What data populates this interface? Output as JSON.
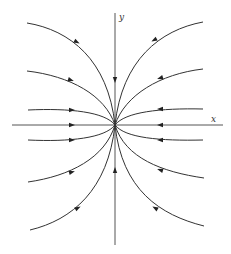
{
  "diagram": {
    "type": "phase-portrait",
    "axes": {
      "x_label": "x",
      "y_label": "y"
    },
    "origin": [
      115,
      125
    ],
    "colors": {
      "stroke": "#333333",
      "background": "#ffffff"
    },
    "trajectories": [
      {
        "name": "upper-left-outer",
        "d": "M27,23 C70,30 108,60 115,125",
        "arrow": [
          77,
          42
        ],
        "angle": 28
      },
      {
        "name": "upper-left-inner",
        "d": "M27,71 C70,76 105,95 115,125",
        "arrow": [
          71,
          80
        ],
        "angle": 18
      },
      {
        "name": "left-upper-flat",
        "d": "M28,110 C70,108 105,112 115,125",
        "arrow": [
          72,
          110
        ],
        "angle": 0
      },
      {
        "name": "left-lower-flat",
        "d": "M28,140 C70,142 105,138 115,125",
        "arrow": [
          72,
          140
        ],
        "angle": 0
      },
      {
        "name": "lower-left-inner",
        "d": "M28,182 C70,176 105,158 115,125",
        "arrow": [
          72,
          172
        ],
        "angle": -16
      },
      {
        "name": "lower-left-outer",
        "d": "M30,230 C72,220 108,190 115,125",
        "arrow": [
          78,
          208
        ],
        "angle": -28
      },
      {
        "name": "upper-right-outer",
        "d": "M203,22 C160,30 122,60 115,125",
        "arrow": [
          154,
          40
        ],
        "angle": 152
      },
      {
        "name": "upper-right-inner",
        "d": "M203,69 C160,74 125,95 115,125",
        "arrow": [
          160,
          78
        ],
        "angle": 162
      },
      {
        "name": "right-upper-flat",
        "d": "M203,109 C160,108 125,112 115,125",
        "arrow": [
          160,
          109
        ],
        "angle": 180
      },
      {
        "name": "right-lower-flat",
        "d": "M203,140 C160,141 125,138 115,125",
        "arrow": [
          160,
          140
        ],
        "angle": 180
      },
      {
        "name": "lower-right-inner",
        "d": "M204,178 C162,172 125,158 115,125",
        "arrow": [
          160,
          170
        ],
        "angle": -162
      },
      {
        "name": "lower-right-outer",
        "d": "M204,226 C160,215 122,190 115,125",
        "arrow": [
          155,
          208
        ],
        "angle": -150
      }
    ],
    "axis_arrows": [
      {
        "name": "y-axis-down-arrow",
        "pos": [
          115,
          80
        ],
        "angle": 90
      },
      {
        "name": "y-axis-up-arrow",
        "pos": [
          115,
          170
        ],
        "angle": -90
      },
      {
        "name": "x-axis-right-arrow",
        "pos": [
          72,
          125
        ],
        "angle": 0
      },
      {
        "name": "x-axis-left-arrow",
        "pos": [
          160,
          125
        ],
        "angle": 180
      }
    ]
  }
}
